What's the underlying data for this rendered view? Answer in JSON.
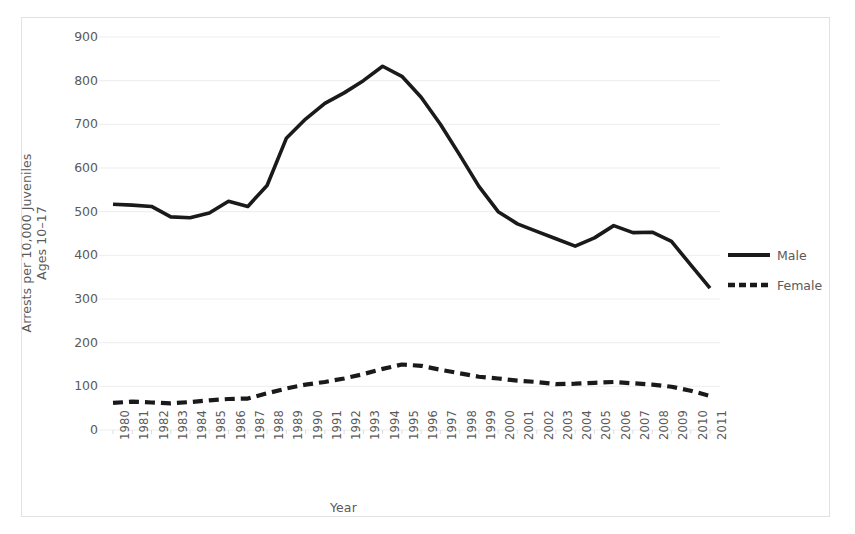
{
  "chart_data": {
    "type": "line",
    "title": "",
    "xlabel": "Year",
    "ylabel": "Arrests per 10,000 Juveniles Ages 10–17",
    "ylabel_line1": "Arrests per 10,000 Juveniles",
    "ylabel_line2": "Ages 10–17",
    "ylim": [
      0,
      900
    ],
    "ytick_step": 100,
    "grid": true,
    "legend_position": "right",
    "x": [
      1980,
      1981,
      1982,
      1983,
      1984,
      1985,
      1986,
      1987,
      1988,
      1989,
      1990,
      1991,
      1992,
      1993,
      1994,
      1995,
      1996,
      1997,
      1998,
      1999,
      2000,
      2001,
      2002,
      2003,
      2004,
      2005,
      2006,
      2007,
      2008,
      2009,
      2010,
      2011
    ],
    "categories": [
      "1980",
      "1981",
      "1982",
      "1983",
      "1984",
      "1985",
      "1986",
      "1987",
      "1988",
      "1989",
      "1990",
      "1991",
      "1992",
      "1993",
      "1994",
      "1995",
      "1996",
      "1997",
      "1998",
      "1999",
      "2000",
      "2001",
      "2002",
      "2003",
      "2004",
      "2005",
      "2006",
      "2007",
      "2008",
      "2009",
      "2010",
      "2011"
    ],
    "yticks": [
      "0",
      "100",
      "200",
      "300",
      "400",
      "500",
      "600",
      "700",
      "800",
      "900"
    ],
    "series": [
      {
        "name": "Male",
        "style": "solid",
        "color": "#1a1a1a",
        "values": [
          517,
          515,
          512,
          488,
          486,
          497,
          524,
          512,
          560,
          668,
          712,
          748,
          772,
          800,
          833,
          810,
          762,
          700,
          630,
          558,
          500,
          472,
          455,
          438,
          421,
          440,
          468,
          452,
          453,
          432,
          378,
          325
        ]
      },
      {
        "name": "Female",
        "style": "dashed",
        "color": "#1a1a1a",
        "values": [
          62,
          65,
          63,
          61,
          64,
          68,
          71,
          72,
          84,
          95,
          104,
          110,
          118,
          128,
          140,
          150,
          147,
          138,
          130,
          122,
          118,
          113,
          110,
          105,
          106,
          108,
          110,
          107,
          104,
          99,
          90,
          78
        ]
      }
    ]
  },
  "legend": {
    "items": [
      {
        "label": "Male",
        "style": "solid"
      },
      {
        "label": "Female",
        "style": "dashed"
      }
    ]
  },
  "axes": {
    "x_title": "Year",
    "y_title_line1": "Arrests per 10,000 Juveniles",
    "y_title_line2": "Ages 10–17"
  },
  "colors": {
    "line": "#1a1a1a",
    "grid": "#ededed",
    "text": "#5a5a5a",
    "frame": "#e2e2e2",
    "background": "#ffffff"
  }
}
